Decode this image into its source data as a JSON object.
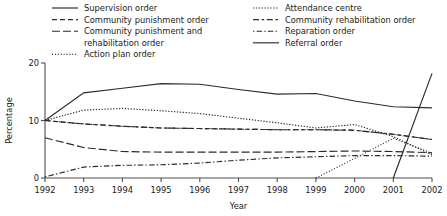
{
  "chart_data": {
    "type": "line",
    "title": "",
    "xlabel": "Year",
    "ylabel": "Percentage",
    "x": [
      1992,
      1993,
      1994,
      1995,
      1996,
      1997,
      1998,
      1999,
      2000,
      2001,
      2002
    ],
    "xticklabels": [
      "1992",
      "1993",
      "1994",
      "1995",
      "1996",
      "1997",
      "1998",
      "1999",
      "2000",
      "2001",
      "2002"
    ],
    "yticks": [
      0,
      10,
      20
    ],
    "yticklabels": [
      "0",
      "10",
      "20"
    ],
    "xlim": [
      1992,
      2002
    ],
    "ylim": [
      0,
      20
    ],
    "grid": false,
    "legend_position": "top",
    "series": [
      {
        "name": "Supervision order",
        "dash": "none",
        "values": [
          10.0,
          14.8,
          15.6,
          16.4,
          16.3,
          15.4,
          14.6,
          14.7,
          13.4,
          12.4,
          12.2
        ]
      },
      {
        "name": "Community punishment order",
        "dash": "dashed",
        "values": [
          10.0,
          9.4,
          9.0,
          8.7,
          8.6,
          8.5,
          8.4,
          8.4,
          8.3,
          7.6,
          6.7
        ]
      },
      {
        "name": "Community punishment and rehabilitation order",
        "dash": "dashdot-long",
        "values": [
          7.0,
          5.3,
          4.6,
          4.5,
          4.5,
          4.5,
          4.5,
          4.6,
          4.7,
          4.6,
          4.4
        ]
      },
      {
        "name": "Action plan order",
        "dash": "dotted-fine",
        "values": [
          null,
          null,
          null,
          null,
          null,
          null,
          null,
          0.0,
          3.4,
          6.9,
          4.3
        ]
      },
      {
        "name": "Attendance centre",
        "dash": "dotted",
        "values": [
          10.0,
          11.8,
          12.1,
          11.7,
          11.2,
          10.4,
          9.6,
          8.7,
          9.3,
          7.2,
          4.0
        ]
      },
      {
        "name": "Community rehabilitation order",
        "dash": "dashdot",
        "values": [
          10.0,
          9.4,
          9.0,
          8.7,
          8.6,
          8.5,
          8.4,
          8.4,
          8.3,
          7.6,
          6.7
        ]
      },
      {
        "name": "Reparation order",
        "dash": "dash-dot-dot",
        "values": [
          0.2,
          1.9,
          2.2,
          2.3,
          2.6,
          3.1,
          3.5,
          3.7,
          3.9,
          3.9,
          3.8
        ]
      },
      {
        "name": "Referral order",
        "dash": "none",
        "values": [
          null,
          null,
          null,
          null,
          null,
          null,
          null,
          null,
          null,
          0.0,
          18.2
        ]
      }
    ],
    "legend_columns": [
      [
        {
          "label": "Supervision order",
          "dash": "none"
        },
        {
          "label": "Community punishment order",
          "dash": "dashed"
        },
        {
          "label": "Community punishment and",
          "dash": "dashdot-long"
        },
        {
          "label": "rehabilitation order",
          "dash": "blank"
        },
        {
          "label": "Action plan order",
          "dash": "dotted-fine"
        }
      ],
      [
        {
          "label": "Attendance centre",
          "dash": "dotted"
        },
        {
          "label": "Community rehabilitation order",
          "dash": "dashdot"
        },
        {
          "label": "Reparation order",
          "dash": "dash-dot-dot"
        },
        {
          "label": "Referral order",
          "dash": "none"
        }
      ]
    ]
  },
  "colors": {
    "ink": "#2b2b2b",
    "axis": "#4d4d4d",
    "background": "#ffffff"
  }
}
